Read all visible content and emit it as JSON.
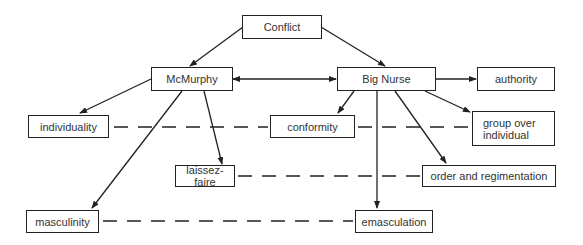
{
  "diagram": {
    "type": "concept-map",
    "nodes": {
      "conflict": {
        "label": "Conflict"
      },
      "mcmurphy": {
        "label": "McMurphy"
      },
      "big_nurse": {
        "label": "Big Nurse"
      },
      "authority": {
        "label": "authority"
      },
      "individuality": {
        "label": "individuality"
      },
      "conformity": {
        "label": "conformity"
      },
      "group_over_individual": {
        "label_line1": "group over",
        "label_line2": "individual"
      },
      "laissez_faire": {
        "label": "laissez-faire"
      },
      "order_and_regimentation": {
        "label": "order and regimentation"
      },
      "masculinity": {
        "label": "masculinity"
      },
      "emasculation": {
        "label": "emasculation"
      }
    },
    "arrows": [
      {
        "from": "Conflict",
        "to": "McMurphy"
      },
      {
        "from": "Conflict",
        "to": "Big Nurse"
      },
      {
        "from": "McMurphy",
        "to": "Big Nurse",
        "bidirectional": true
      },
      {
        "from": "Big Nurse",
        "to": "authority"
      },
      {
        "from": "McMurphy",
        "to": "individuality"
      },
      {
        "from": "McMurphy",
        "to": "laissez-faire"
      },
      {
        "from": "McMurphy",
        "to": "masculinity"
      },
      {
        "from": "Big Nurse",
        "to": "conformity"
      },
      {
        "from": "Big Nurse",
        "to": "group over individual"
      },
      {
        "from": "Big Nurse",
        "to": "order and regimentation"
      },
      {
        "from": "Big Nurse",
        "to": "emasculation"
      }
    ],
    "dashed_links": [
      {
        "a": "individuality",
        "b": "conformity"
      },
      {
        "a": "conformity",
        "b": "group over individual"
      },
      {
        "a": "laissez-faire",
        "b": "order and regimentation"
      },
      {
        "a": "masculinity",
        "b": "emasculation"
      }
    ]
  }
}
